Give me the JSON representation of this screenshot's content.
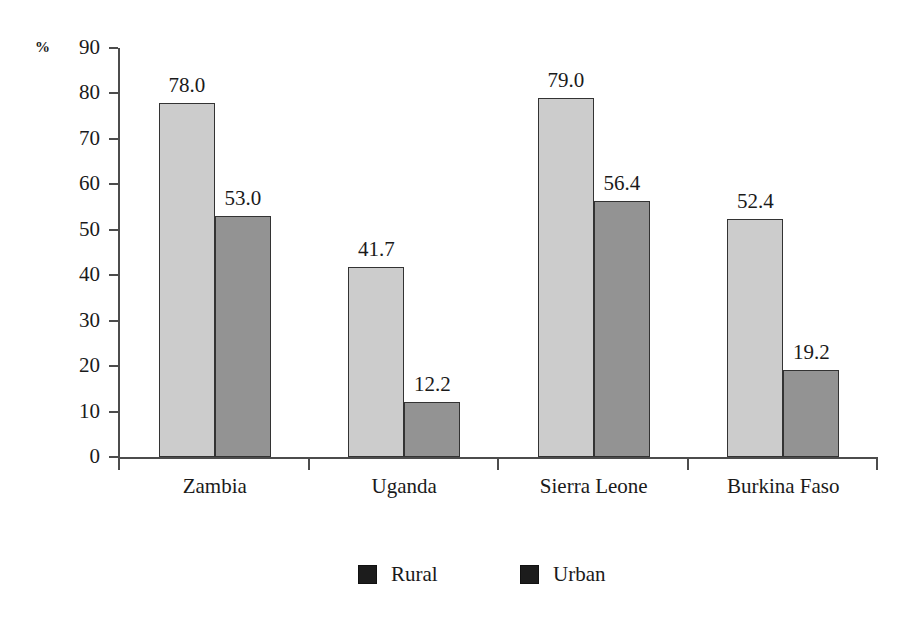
{
  "chart_data": {
    "type": "bar",
    "title": "",
    "xlabel": "",
    "ylabel": "%",
    "ylim": [
      0,
      90
    ],
    "ytick_step": 10,
    "grid": false,
    "legend_position": "bottom",
    "categories": [
      "Zambia",
      "Uganda",
      "Sierra Leone",
      "Burkina Faso"
    ],
    "series": [
      {
        "name": "Rural",
        "color": "#cccccc",
        "values": [
          78.0,
          41.7,
          79.0,
          52.4
        ],
        "labels": [
          "78.0",
          "41.7",
          "79.0",
          "52.4"
        ]
      },
      {
        "name": "Urban",
        "color": "#939393",
        "values": [
          53.0,
          12.2,
          56.4,
          19.2
        ],
        "labels": [
          "53.0",
          "12.2",
          "56.4",
          "19.2"
        ]
      }
    ],
    "ytick_labels": [
      "90",
      "80",
      "70",
      "60",
      "50",
      "40",
      "30",
      "20",
      "10",
      "0"
    ],
    "ytick_values": [
      90,
      80,
      70,
      60,
      50,
      40,
      30,
      20,
      10,
      0
    ]
  },
  "axis": {
    "unit_label": "%"
  },
  "legend": {
    "entries": [
      {
        "label": "Rural",
        "swatch_color": "#1c1c1c"
      },
      {
        "label": "Urban",
        "swatch_color": "#1c1c1c"
      }
    ]
  },
  "colors": {
    "rural_bar": "#cccccc",
    "urban_bar": "#939393",
    "bar_outline": "#333333",
    "axis": "#4c4c4c",
    "text": "#1a1a1a",
    "background": "#ffffff"
  }
}
